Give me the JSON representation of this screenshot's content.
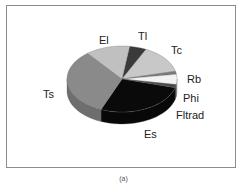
{
  "chart_data": {
    "type": "pie",
    "style": "3d",
    "title": "",
    "caption": "(a)",
    "categories": [
      "Tl",
      "Tc",
      "Rb",
      "Phi",
      "Fltrad",
      "Es",
      "Ts",
      "El"
    ],
    "values": [
      5,
      14,
      1.5,
      5,
      1.5,
      27,
      33,
      13
    ],
    "colors": [
      "#3a3a3a",
      "#c8c8c8",
      "#7a7a7a",
      "#f2f2f2",
      "#4a4a4a",
      "#0a0a0a",
      "#8a8a8a",
      "#c0c0c0"
    ],
    "legend": "none (inline labels)"
  },
  "labels": {
    "tl": "Tl",
    "tc": "Tc",
    "rb": "Rb",
    "phi": "Phi",
    "fltrad": "Fltrad",
    "es": "Es",
    "ts": "Ts",
    "el": "El"
  },
  "caption": "(a)"
}
